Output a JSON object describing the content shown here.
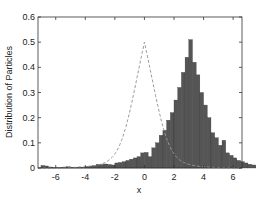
{
  "chart_data": {
    "type": "bar",
    "title": "",
    "xlabel": "x",
    "ylabel": "Distribution of Particles",
    "xlim": [
      -7.2,
      6.6
    ],
    "ylim": [
      0,
      0.6
    ],
    "xticks": [
      -6,
      -4,
      -2,
      0,
      2,
      4,
      6
    ],
    "yticks": [
      0,
      0.1,
      0.2,
      0.3,
      0.4,
      0.5,
      0.6
    ],
    "grid": false,
    "bin_width": 0.25,
    "bin_start": -7.0,
    "values": [
      0.01,
      0.008,
      0.004,
      0.003,
      0.002,
      0.003,
      0.004,
      0.005,
      0.003,
      0.002,
      0.004,
      0.003,
      0.006,
      0.008,
      0.01,
      0.015,
      0.014,
      0.016,
      0.014,
      0.012,
      0.02,
      0.022,
      0.025,
      0.03,
      0.035,
      0.04,
      0.045,
      0.06,
      0.062,
      0.045,
      0.08,
      0.1,
      0.13,
      0.15,
      0.19,
      0.22,
      0.27,
      0.32,
      0.38,
      0.44,
      0.51,
      0.42,
      0.37,
      0.3,
      0.25,
      0.2,
      0.14,
      0.12,
      0.09,
      0.11,
      0.06,
      0.05,
      0.04,
      0.03,
      0.025,
      0.02,
      0.015,
      0.012,
      0.01,
      0.008,
      0.006,
      0.005,
      0.005,
      0.004,
      0.003,
      0.003,
      0.002,
      0.002,
      0.003,
      0.006,
      0.008,
      0.005,
      0.004,
      0.003,
      0.002
    ],
    "fit_curve": {
      "style": "dashed",
      "color": "#999999",
      "type": "laplace-like",
      "peak": 0.5,
      "center": 0.0,
      "scale": 1.0
    },
    "bar_color": "#555555",
    "bar_edge": "#333333"
  },
  "axes": {
    "xlabel": "x",
    "ylabel": "Distribution of Particles",
    "xtick_labels": [
      "-6",
      "-4",
      "-2",
      "0",
      "2",
      "4",
      "6"
    ],
    "ytick_labels": [
      "0",
      "0.1",
      "0.2",
      "0.3",
      "0.4",
      "0.5",
      "0.6"
    ]
  }
}
